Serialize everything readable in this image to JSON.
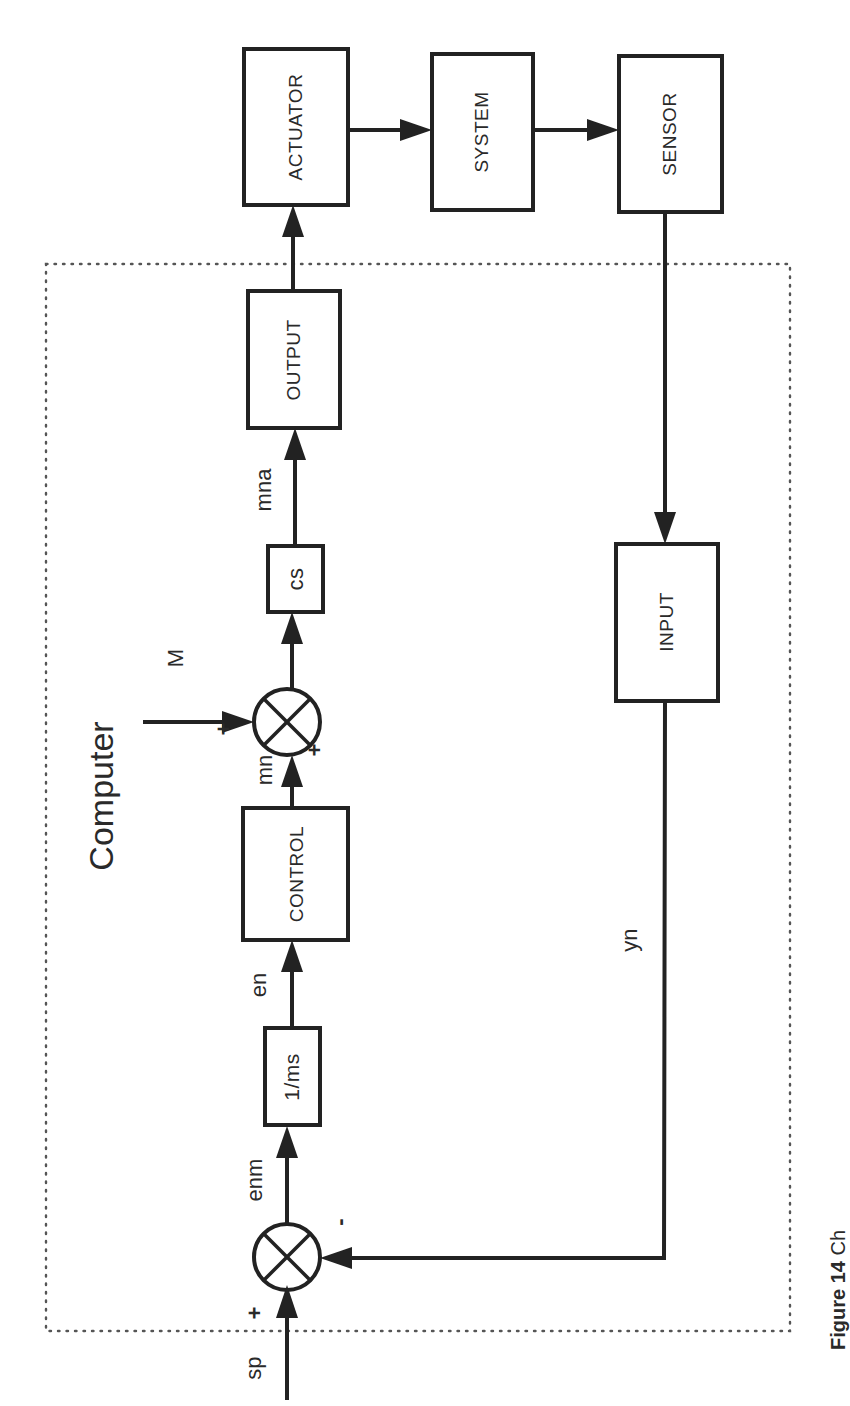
{
  "diagram": {
    "title": "Computer",
    "blocks": {
      "actuator": "ACTUATOR",
      "system": "SYSTEM",
      "sensor": "SENSOR",
      "output": "OUTPUT",
      "cs": "cs",
      "control": "CONTROL",
      "inv_ms": "1/ms",
      "input": "INPUT"
    },
    "signals": {
      "sp": "sp",
      "enm": "enm",
      "en": "en",
      "mn": "mn",
      "M": "M",
      "mna": "mna",
      "yn": "yn"
    },
    "signs": {
      "sum1_plus": "+",
      "sum1_minus": "-",
      "sum2_plus_mn": "+",
      "sum2_plus_M": "+"
    },
    "caption": {
      "label": "Figure 14",
      "text": "Ch"
    },
    "colors": {
      "ink": "#222222",
      "border_dots": "#555555",
      "background": "#ffffff"
    }
  }
}
